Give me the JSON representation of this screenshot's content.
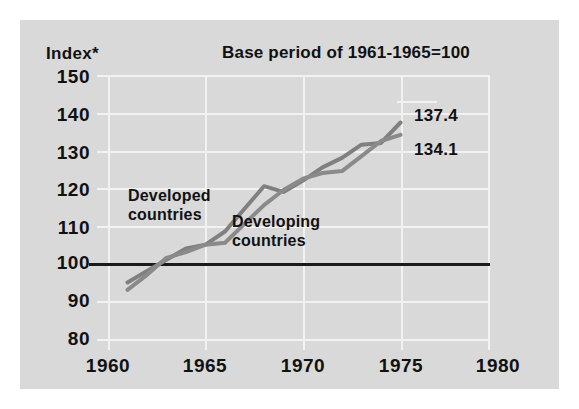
{
  "chart_data": {
    "type": "line",
    "title": "Base period of 1961-1965=100",
    "ylabel": "Index*",
    "xlabel": "",
    "xlim": [
      1960,
      1980
    ],
    "ylim": [
      75,
      152
    ],
    "grid": true,
    "baseline": 100,
    "legend_position": "inline-annotations",
    "xticks": [
      "1960",
      "1965",
      "1970",
      "1975",
      "1980"
    ],
    "yticks": [
      "150",
      "140",
      "130",
      "120",
      "110",
      "100",
      "90",
      "80"
    ],
    "series": [
      {
        "name": "Developed countries",
        "end_value_label": "137.4",
        "x": [
          1961,
          1962,
          1963,
          1964,
          1965,
          1966,
          1967,
          1968,
          1969,
          1970,
          1971,
          1972,
          1973,
          1974,
          1975
        ],
        "values": [
          95.0,
          98.0,
          101.0,
          104.0,
          105.0,
          108.5,
          114.5,
          120.5,
          119.0,
          122.0,
          125.5,
          128.0,
          131.5,
          132.0,
          137.4
        ]
      },
      {
        "name": "Developing countries",
        "end_value_label": "134.1",
        "x": [
          1961,
          1962,
          1963,
          1964,
          1965,
          1966,
          1967,
          1968,
          1969,
          1970,
          1971,
          1972,
          1973,
          1974,
          1975
        ],
        "values": [
          93.0,
          97.0,
          101.5,
          103.0,
          105.0,
          105.5,
          110.5,
          115.5,
          119.5,
          122.5,
          124.0,
          124.5,
          128.5,
          132.5,
          134.1
        ]
      }
    ],
    "annotations": [
      {
        "text": "Developed countries",
        "line1": "Developed",
        "line2": "countries"
      },
      {
        "text": "Developing countries",
        "line1": "Developing",
        "line2": "countries"
      }
    ],
    "colors": {
      "panel_background": "#d9d9d9",
      "gridline": "#f2f2f2",
      "baseline": "#1a1a1a",
      "series_line": "#808080",
      "text": "#111111"
    }
  },
  "labels": {
    "axis_label": "Index*",
    "title": "Base period of 1961-1965=100",
    "developed_line1": "Developed",
    "developed_line2": "countries",
    "developing_line1": "Developing",
    "developing_line2": "countries",
    "value_top": "137.4",
    "value_bottom": "134.1",
    "y_150": "150",
    "y_140": "140",
    "y_130": "130",
    "y_120": "120",
    "y_110": "110",
    "y_100": "100",
    "y_90": "90",
    "y_80": "80",
    "x_1960": "1960",
    "x_1965": "1965",
    "x_1970": "1970",
    "x_1975": "1975",
    "x_1980": "1980"
  }
}
